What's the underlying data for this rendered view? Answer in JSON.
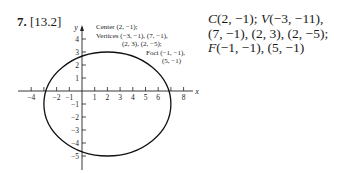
{
  "problem": {
    "number": "7.",
    "section": "[13.2]"
  },
  "graph": {
    "axis_labels": {
      "x": "x",
      "y": "y"
    },
    "x_ticks": [
      {
        "value": -4,
        "label": "−4"
      },
      {
        "value": -3,
        "label": ""
      },
      {
        "value": -2,
        "label": "−2"
      },
      {
        "value": -1,
        "label": "−1"
      },
      {
        "value": 1,
        "label": "1"
      },
      {
        "value": 2,
        "label": "2"
      },
      {
        "value": 3,
        "label": "3"
      },
      {
        "value": 4,
        "label": "4"
      },
      {
        "value": 5,
        "label": "5"
      },
      {
        "value": 6,
        "label": "6"
      },
      {
        "value": 7,
        "label": ""
      },
      {
        "value": 8,
        "label": "8"
      }
    ],
    "y_ticks": [
      {
        "value": 4,
        "label": "4"
      },
      {
        "value": 3,
        "label": "3"
      },
      {
        "value": 2,
        "label": "2"
      },
      {
        "value": 1,
        "label": "1"
      },
      {
        "value": -1,
        "label": "−1"
      },
      {
        "value": -2,
        "label": "−2"
      },
      {
        "value": -3,
        "label": "−3"
      },
      {
        "value": -4,
        "label": "−4"
      },
      {
        "value": -5,
        "label": "−5"
      }
    ],
    "ellipse": {
      "center": [
        2,
        -1
      ],
      "a": 5,
      "b": 4
    },
    "annotations": {
      "line1": "Center (2, −1);",
      "line2": "Vertices (−3, −1), (7, −1),",
      "line3": "(2, 3), (2, −5);",
      "line4": "Foci (−1, −1),",
      "line5": "(5, −1)"
    }
  },
  "answer": {
    "line1_c": "C",
    "line1_a": "(2, −1); ",
    "line1_v": "V",
    "line1_b": "(−3, −11),",
    "line2": "(7, −1), (2, 3), (2, −5);",
    "line3_f": "F",
    "line3_a": "(−1, −1), (5, −1)"
  }
}
